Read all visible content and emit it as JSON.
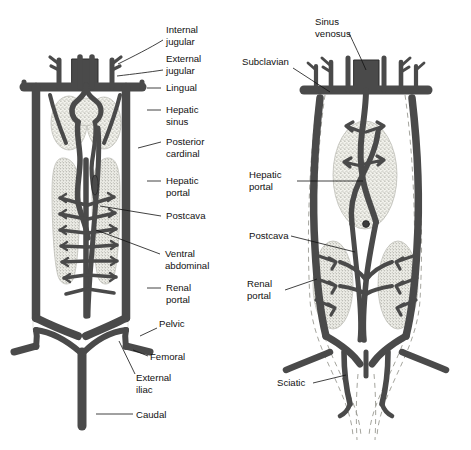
{
  "figure": {
    "background_color": "#ffffff",
    "vessel_color": "#4a4a4a",
    "vessel_outline_color": "#1c1c1c",
    "organ_fill_color": "#efefe9",
    "organ_stipple_color": "#8d8d85",
    "label_color": "#111111",
    "leader_color": "#111111"
  },
  "panels": [
    {
      "id": "left-panel",
      "name": "amphibian-venous-system",
      "labels": [
        {
          "id": "internal-jugular",
          "text": "Internal\njugular",
          "line1": "Internal",
          "line2": "jugular"
        },
        {
          "id": "external-jugular",
          "text": "External\njugular",
          "line1": "External",
          "line2": "jugular"
        },
        {
          "id": "lingual",
          "text": "Lingual",
          "line1": "Lingual",
          "line2": ""
        },
        {
          "id": "hepatic-sinus",
          "text": "Hepatic\nsinus",
          "line1": "Hepatic",
          "line2": "sinus"
        },
        {
          "id": "posterior-cardinal",
          "text": "Posterior\ncardinal",
          "line1": "Posterior",
          "line2": "cardinal"
        },
        {
          "id": "hepatic-portal",
          "text": "Hepatic\nportal",
          "line1": "Hepatic",
          "line2": "portal"
        },
        {
          "id": "postcava",
          "text": "Postcava",
          "line1": "Postcava",
          "line2": ""
        },
        {
          "id": "ventral-abdominal",
          "text": "Ventral\nabdominal",
          "line1": "Ventral",
          "line2": "abdominal"
        },
        {
          "id": "renal-portal",
          "text": "Renal\nportal",
          "line1": "Renal",
          "line2": "portal"
        },
        {
          "id": "pelvic",
          "text": "Pelvic",
          "line1": "Pelvic",
          "line2": ""
        },
        {
          "id": "femoral",
          "text": "Femoral",
          "line1": "Femoral",
          "line2": ""
        },
        {
          "id": "external-iliac",
          "text": "External\niliac",
          "line1": "External",
          "line2": "iliac"
        },
        {
          "id": "caudal",
          "text": "Caudal",
          "line1": "Caudal",
          "line2": ""
        }
      ]
    },
    {
      "id": "right-panel",
      "name": "reptilian-venous-system",
      "labels": [
        {
          "id": "sinus-venosus",
          "text": "Sinus\nvenosus",
          "line1": "Sinus",
          "line2": "venosus"
        },
        {
          "id": "subclavian",
          "text": "Subclavian",
          "line1": "Subclavian",
          "line2": ""
        },
        {
          "id": "hepatic-portal",
          "text": "Hepatic\nportal",
          "line1": "Hepatic",
          "line2": "portal"
        },
        {
          "id": "postcava",
          "text": "Postcava",
          "line1": "Postcava",
          "line2": ""
        },
        {
          "id": "renal-portal",
          "text": "Renal\nportal",
          "line1": "Renal",
          "line2": "portal"
        },
        {
          "id": "sciatic",
          "text": "Sciatic",
          "line1": "Sciatic",
          "line2": ""
        }
      ]
    }
  ]
}
